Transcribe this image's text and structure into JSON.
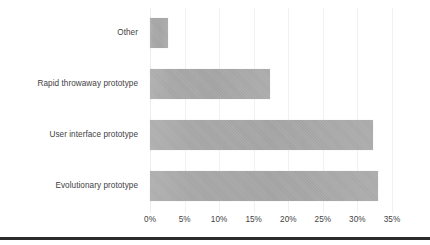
{
  "chart_data": {
    "type": "bar",
    "orientation": "horizontal",
    "title": "",
    "subtitle": "",
    "xlabel": "",
    "ylabel": "",
    "categories": [
      "Evolutionary prototype",
      "User interface prototype",
      "Rapid throwaway prototype",
      "Other"
    ],
    "values": [
      33.0,
      32.3,
      17.4,
      2.6
    ],
    "value_labels": [
      "33%",
      "32.3%",
      "17.4%",
      "2.6%"
    ],
    "xlim": [
      0,
      35
    ],
    "xticks": [
      0,
      5,
      10,
      15,
      20,
      25,
      30,
      35
    ],
    "xtick_labels": [
      "0%",
      "5%",
      "10%",
      "15%",
      "20%",
      "25%",
      "30%",
      "35%"
    ],
    "grid": true,
    "grid_axis": "x",
    "legend": false,
    "legend_position": "none",
    "series": [
      {
        "name": "Share of respondents",
        "values": [
          33.0,
          32.3,
          17.4,
          2.6
        ]
      }
    ]
  },
  "style": {
    "bar_color": "#a9a9a9",
    "grid_color": "#f1f1f1",
    "text_color": "#3f3f3f",
    "background": "#ffffff",
    "rule_color": "#2b2b2b"
  }
}
